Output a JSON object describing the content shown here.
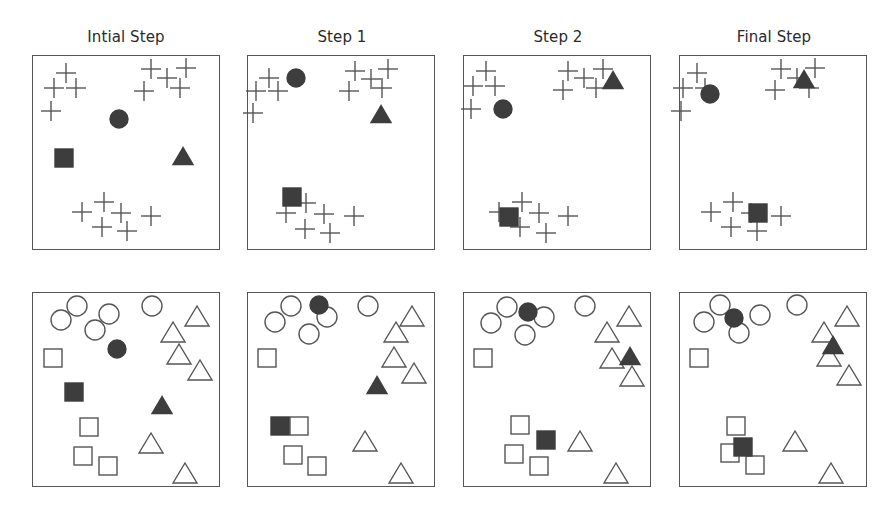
{
  "titles": [
    "Intial Step",
    "Step 1",
    "Step 2",
    "Final Step"
  ],
  "colors": {
    "filled": "#3d3d3d",
    "outline": "#555555",
    "stroke": "#555555"
  },
  "layout": {
    "panel_x": [
      32,
      247,
      463,
      679
    ],
    "row_y": [
      55,
      292
    ],
    "panel_w": 188,
    "panel_h": 195
  },
  "top_row": [
    {
      "name": "Intial Step",
      "crosses": [
        [
          33,
          17
        ],
        [
          21,
          32
        ],
        [
          43,
          32
        ],
        [
          18,
          55
        ],
        [
          118,
          13
        ],
        [
          134,
          22
        ],
        [
          153,
          12
        ],
        [
          111,
          35
        ],
        [
          147,
          32
        ],
        [
          49,
          156
        ],
        [
          71,
          146
        ],
        [
          88,
          157
        ],
        [
          69,
          171
        ],
        [
          94,
          175
        ],
        [
          118,
          160
        ]
      ],
      "circle": [
        86,
        63
      ],
      "square": [
        31,
        102
      ],
      "triangle": [
        150,
        100
      ]
    },
    {
      "name": "Step 1",
      "crosses": [
        [
          21,
          22
        ],
        [
          8,
          35
        ],
        [
          30,
          35
        ],
        [
          5,
          57
        ],
        [
          107,
          15
        ],
        [
          123,
          23
        ],
        [
          140,
          13
        ],
        [
          101,
          35
        ],
        [
          134,
          32
        ],
        [
          38,
          157
        ],
        [
          58,
          147
        ],
        [
          76,
          158
        ],
        [
          57,
          173
        ],
        [
          82,
          177
        ],
        [
          106,
          160
        ]
      ],
      "circle": [
        48,
        22
      ],
      "square": [
        44,
        141
      ],
      "triangle": [
        133,
        58
      ]
    },
    {
      "name": "Step 2",
      "crosses": [
        [
          22,
          15
        ],
        [
          9,
          30
        ],
        [
          31,
          30
        ],
        [
          7,
          53
        ],
        [
          104,
          15
        ],
        [
          120,
          22
        ],
        [
          139,
          13
        ],
        [
          99,
          34
        ],
        [
          132,
          32
        ],
        [
          35,
          156
        ],
        [
          58,
          146
        ],
        [
          75,
          157
        ],
        [
          56,
          171
        ],
        [
          82,
          177
        ],
        [
          104,
          160
        ]
      ],
      "circle": [
        39,
        53
      ],
      "square": [
        45,
        161
      ],
      "triangle": [
        149,
        24
      ]
    },
    {
      "name": "Final Step",
      "crosses": [
        [
          17,
          17
        ],
        [
          3,
          32
        ],
        [
          25,
          32
        ],
        [
          1,
          55
        ],
        [
          101,
          13
        ],
        [
          117,
          22
        ],
        [
          135,
          12
        ],
        [
          95,
          34
        ],
        [
          129,
          32
        ],
        [
          31,
          156
        ],
        [
          53,
          146
        ],
        [
          71,
          157
        ],
        [
          51,
          171
        ],
        [
          77,
          175
        ],
        [
          101,
          160
        ]
      ],
      "circle": [
        30,
        38
      ],
      "square": [
        78,
        157
      ],
      "triangle": [
        124,
        23
      ]
    }
  ],
  "bottom_row": [
    {
      "name": "Intial Step",
      "circles_open": [
        [
          44,
          13
        ],
        [
          28,
          27
        ],
        [
          76,
          21
        ],
        [
          62,
          37
        ],
        [
          119,
          13
        ]
      ],
      "triangles_open": [
        [
          164,
          23
        ],
        [
          140,
          39
        ],
        [
          146,
          61
        ],
        [
          167,
          77
        ],
        [
          118,
          150
        ],
        [
          152,
          180
        ]
      ],
      "squares_open": [
        [
          20,
          65
        ],
        [
          56,
          134
        ],
        [
          50,
          163
        ],
        [
          75,
          173
        ]
      ],
      "filled_circle": [
        84,
        56
      ],
      "filled_triangle": [
        129,
        112
      ],
      "filled_square": [
        41,
        99
      ]
    },
    {
      "name": "Step 1",
      "circles_open": [
        [
          43,
          13
        ],
        [
          27,
          29
        ],
        [
          79,
          24
        ],
        [
          61,
          41
        ],
        [
          120,
          13
        ]
      ],
      "triangles_open": [
        [
          164,
          23
        ],
        [
          148,
          39
        ],
        [
          146,
          64
        ],
        [
          166,
          80
        ],
        [
          117,
          148
        ],
        [
          153,
          180
        ]
      ],
      "squares_open": [
        [
          19,
          65
        ],
        [
          51,
          133
        ],
        [
          45,
          162
        ],
        [
          69,
          173
        ]
      ],
      "filled_circle": [
        71,
        12
      ],
      "filled_triangle": [
        129,
        92
      ],
      "filled_square": [
        32,
        133
      ]
    },
    {
      "name": "Step 2",
      "circles_open": [
        [
          43,
          14
        ],
        [
          27,
          30
        ],
        [
          80,
          24
        ],
        [
          61,
          42
        ],
        [
          121,
          13
        ]
      ],
      "triangles_open": [
        [
          165,
          23
        ],
        [
          143,
          39
        ],
        [
          148,
          65
        ],
        [
          168,
          83
        ],
        [
          116,
          148
        ],
        [
          152,
          180
        ]
      ],
      "squares_open": [
        [
          19,
          65
        ],
        [
          56,
          132
        ],
        [
          50,
          161
        ],
        [
          75,
          173
        ]
      ],
      "filled_circle": [
        64,
        19
      ],
      "filled_triangle": [
        166,
        63
      ],
      "filled_square": [
        82,
        147
      ]
    },
    {
      "name": "Final Step",
      "circles_open": [
        [
          40,
          12
        ],
        [
          24,
          29
        ],
        [
          80,
          22
        ],
        [
          59,
          40
        ],
        [
          117,
          12
        ]
      ],
      "triangles_open": [
        [
          167,
          23
        ],
        [
          144,
          39
        ],
        [
          149,
          63
        ],
        [
          169,
          82
        ],
        [
          115,
          148
        ],
        [
          151,
          180
        ]
      ],
      "squares_open": [
        [
          19,
          65
        ],
        [
          56,
          133
        ],
        [
          50,
          160
        ],
        [
          75,
          172
        ]
      ],
      "filled_circle": [
        54,
        25
      ],
      "filled_triangle": [
        153,
        52
      ],
      "filled_square": [
        63,
        154
      ]
    }
  ]
}
